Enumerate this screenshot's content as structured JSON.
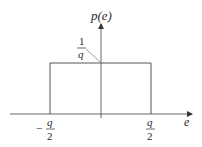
{
  "diagram": {
    "y_axis_label": "p(e)",
    "x_axis_label": "e",
    "height_label": {
      "numerator": "1",
      "denominator": "q"
    },
    "left_bound": {
      "sign": "−",
      "numerator": "q",
      "denominator": "2"
    },
    "right_bound": {
      "numerator": "q",
      "denominator": "2"
    },
    "line_color": "#555555"
  }
}
